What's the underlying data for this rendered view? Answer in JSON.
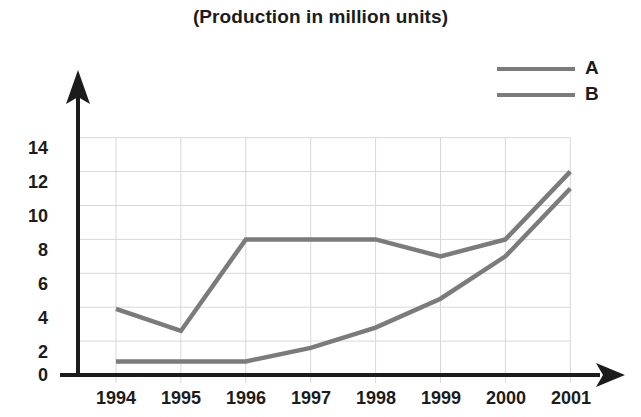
{
  "chart_data": {
    "type": "line",
    "title": "(Production in million units)",
    "xlabel": "",
    "ylabel": "",
    "categories": [
      "1994",
      "1995",
      "1996",
      "1997",
      "1998",
      "1999",
      "2000",
      "2001"
    ],
    "x": [
      1994,
      1995,
      1996,
      1997,
      1998,
      1999,
      2000,
      2001
    ],
    "series": [
      {
        "name": "A",
        "values": [
          3.9,
          2.6,
          8.0,
          8.0,
          8.0,
          7.0,
          8.0,
          12.0
        ],
        "color": "#7b7b7b"
      },
      {
        "name": "B",
        "values": [
          0.8,
          0.8,
          0.8,
          1.6,
          2.8,
          4.5,
          7.0,
          11.0
        ],
        "color": "#7b7b7b"
      }
    ],
    "ylim": [
      0,
      15
    ],
    "yticks": [
      0,
      2,
      4,
      6,
      8,
      10,
      12,
      14
    ],
    "ytick_labels": [
      "0",
      "2",
      "4",
      "6",
      "8",
      "10",
      "12",
      "14"
    ],
    "grid": true,
    "grid_color": "#d8d8d8",
    "legend_position": "top-right",
    "axis_color": "#1c1c1c",
    "background": "#ffffff"
  },
  "legend": {
    "entries": [
      {
        "label": "A"
      },
      {
        "label": "B"
      }
    ]
  },
  "icons": {
    "y_axis_arrow": "arrow-up-icon",
    "x_axis_arrow": "arrow-right-icon"
  }
}
